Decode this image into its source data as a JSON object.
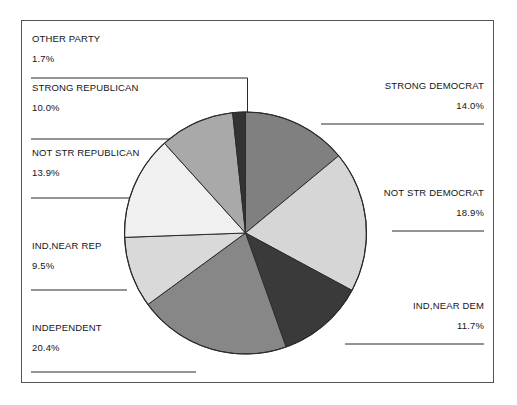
{
  "chart_data": {
    "type": "pie",
    "title": "",
    "subtitle": "",
    "xlabel": "",
    "ylabel": "",
    "legend_position": "none",
    "grid": false,
    "units": "percent",
    "start_angle_deg": 0,
    "direction": "clockwise",
    "categories": [
      "STRONG DEMOCRAT",
      "NOT STR DEMOCRAT",
      "IND,NEAR DEM",
      "INDEPENDENT",
      "IND,NEAR REP",
      "NOT STR REPUBLICAN",
      "STRONG REPUBLICAN",
      "OTHER PARTY"
    ],
    "values": [
      14.0,
      18.9,
      11.7,
      20.4,
      9.5,
      13.9,
      10.0,
      1.7
    ],
    "value_labels": [
      "14.0%",
      "18.9%",
      "11.7%",
      "20.4%",
      "9.5%",
      "13.9%",
      "10.0%",
      "1.7%"
    ],
    "colors": [
      "#808080",
      "#d6d6d6",
      "#3a3a3a",
      "#878787",
      "#d9d9d9",
      "#f0f0f0",
      "#a9a9a9",
      "#333333"
    ],
    "slice_outline_color": "#2b2b2b",
    "frame_color": "#555555",
    "background_color": "#ffffff",
    "text_color": "#141414",
    "slices": [
      {
        "name": "STRONG DEMOCRAT",
        "value": 14.0,
        "value_label": "14.0%",
        "color": "#808080",
        "label_side": "right"
      },
      {
        "name": "NOT STR DEMOCRAT",
        "value": 18.9,
        "value_label": "18.9%",
        "color": "#d6d6d6",
        "label_side": "right"
      },
      {
        "name": "IND,NEAR DEM",
        "value": 11.7,
        "value_label": "11.7%",
        "color": "#3a3a3a",
        "label_side": "right"
      },
      {
        "name": "INDEPENDENT",
        "value": 20.4,
        "value_label": "20.4%",
        "color": "#878787",
        "label_side": "left"
      },
      {
        "name": "IND,NEAR REP",
        "value": 9.5,
        "value_label": "9.5%",
        "color": "#d9d9d9",
        "label_side": "left"
      },
      {
        "name": "NOT STR REPUBLICAN",
        "value": 13.9,
        "value_label": "13.9%",
        "color": "#f0f0f0",
        "label_side": "left"
      },
      {
        "name": "STRONG REPUBLICAN",
        "value": 10.0,
        "value_label": "10.0%",
        "color": "#a9a9a9",
        "label_side": "left"
      },
      {
        "name": "OTHER PARTY",
        "value": 1.7,
        "value_label": "1.7%",
        "color": "#333333",
        "label_side": "left"
      }
    ]
  },
  "labels": {
    "strong_democrat": {
      "name": "STRONG DEMOCRAT",
      "pct": "14.0%"
    },
    "not_str_democrat": {
      "name": "NOT STR DEMOCRAT",
      "pct": "18.9%"
    },
    "ind_near_dem": {
      "name": "IND,NEAR DEM",
      "pct": "11.7%"
    },
    "independent": {
      "name": "INDEPENDENT",
      "pct": "20.4%"
    },
    "ind_near_rep": {
      "name": "IND,NEAR REP",
      "pct": "9.5%"
    },
    "not_str_republican": {
      "name": "NOT STR REPUBLICAN",
      "pct": "13.9%"
    },
    "strong_republican": {
      "name": "STRONG REPUBLICAN",
      "pct": "10.0%"
    },
    "other_party": {
      "name": "OTHER PARTY",
      "pct": "1.7%"
    }
  }
}
